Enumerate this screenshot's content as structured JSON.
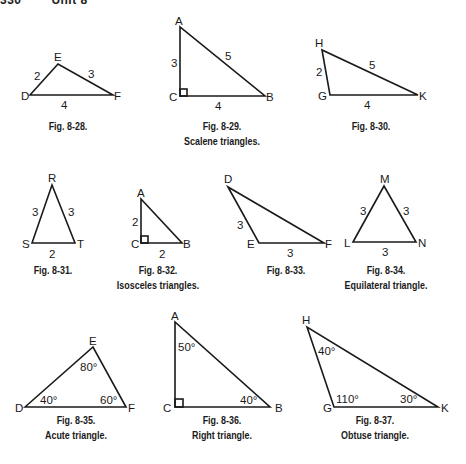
{
  "header": {
    "page_number": "330",
    "unit": "Unit 8"
  },
  "figures": [
    {
      "id": "fig-8-28",
      "caption": "Fig. 8-28.",
      "subcaption": "",
      "vertices": [
        "D",
        "E",
        "F"
      ],
      "sides": {
        "DE": "2",
        "EF": "3",
        "DF": "4"
      }
    },
    {
      "id": "fig-8-29",
      "caption": "Fig. 8-29.",
      "subcaption": "Scalene triangles.",
      "vertices": [
        "A",
        "C",
        "B"
      ],
      "sides": {
        "AC": "3",
        "AB": "5",
        "CB": "4"
      },
      "right_angle_at": "C"
    },
    {
      "id": "fig-8-30",
      "caption": "Fig. 8-30.",
      "subcaption": "",
      "vertices": [
        "H",
        "G",
        "K"
      ],
      "sides": {
        "HG": "2",
        "HK": "5",
        "GK": "4"
      }
    },
    {
      "id": "fig-8-31",
      "caption": "Fig. 8-31.",
      "subcaption": "",
      "vertices": [
        "R",
        "S",
        "T"
      ],
      "sides": {
        "RS": "3",
        "RT": "3",
        "ST": "2"
      }
    },
    {
      "id": "fig-8-32",
      "caption": "Fig. 8-32.",
      "subcaption": "Isosceles triangles.",
      "vertices": [
        "A",
        "C",
        "B"
      ],
      "sides": {
        "AC": "2",
        "CB": "2"
      },
      "right_angle_at": "C"
    },
    {
      "id": "fig-8-33",
      "caption": "Fig. 8-33.",
      "subcaption": "",
      "vertices": [
        "D",
        "E",
        "F"
      ],
      "sides": {
        "DE": "3",
        "EF": "3"
      }
    },
    {
      "id": "fig-8-34",
      "caption": "Fig. 8-34.",
      "subcaption": "Equilateral triangle.",
      "vertices": [
        "M",
        "L",
        "N"
      ],
      "sides": {
        "LM": "3",
        "MN": "3",
        "LN": "3"
      }
    },
    {
      "id": "fig-8-35",
      "caption": "Fig. 8-35.",
      "subcaption": "Acute triangle.",
      "vertices": [
        "D",
        "E",
        "F"
      ],
      "angles": {
        "D": "40°",
        "E": "80°",
        "F": "60°"
      }
    },
    {
      "id": "fig-8-36",
      "caption": "Fig. 8-36.",
      "subcaption": "Right triangle.",
      "vertices": [
        "A",
        "C",
        "B"
      ],
      "angles": {
        "A": "50°",
        "B": "40°"
      },
      "right_angle_at": "C"
    },
    {
      "id": "fig-8-37",
      "caption": "Fig. 8-37.",
      "subcaption": "Obtuse triangle.",
      "vertices": [
        "H",
        "G",
        "K"
      ],
      "angles": {
        "H": "40°",
        "G": "110°",
        "K": "30°"
      }
    }
  ]
}
